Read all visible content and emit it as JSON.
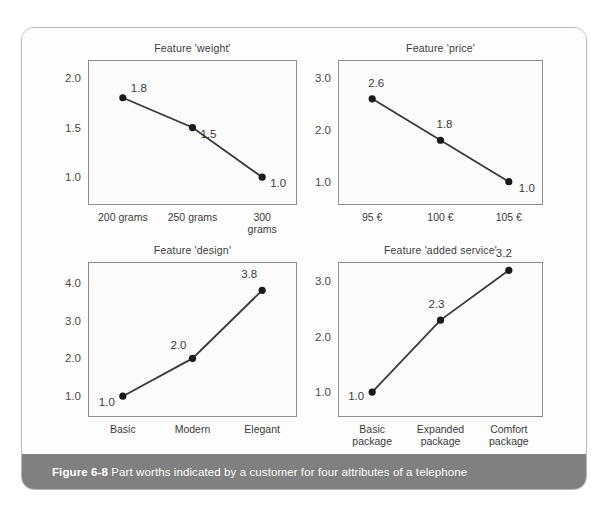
{
  "figure": {
    "caption_label": "Figure 6-8",
    "caption_text": "Part worths indicated by a customer for four attributes of a telephone",
    "caption_bar_color": "#808080",
    "card_border_color": "#b9b9b9",
    "background_color": "#ffffff"
  },
  "chart_data": [
    {
      "type": "line",
      "title": "Feature 'weight'",
      "categories": [
        "200 grams",
        "250 grams",
        "300 grams"
      ],
      "values": [
        1.8,
        1.5,
        1.0
      ],
      "point_labels": [
        "1.8",
        "1.5",
        "1.0"
      ],
      "yticks": [
        "1.0",
        "1.5",
        "2.0"
      ],
      "ytick_values": [
        1.0,
        1.5,
        2.0
      ],
      "ylim": [
        0.72,
        2.18
      ],
      "xlabel": "",
      "ylabel": "",
      "grid": false,
      "legend": "none",
      "marker": "filled-circle",
      "line_color": "#3a3a3a"
    },
    {
      "type": "line",
      "title": "Feature 'price'",
      "categories": [
        "95 €",
        "100 €",
        "105 €"
      ],
      "values": [
        2.6,
        1.8,
        1.0
      ],
      "point_labels": [
        "2.6",
        "1.8",
        "1.0"
      ],
      "yticks": [
        "1.0",
        "2.0",
        "3.0"
      ],
      "ytick_values": [
        1.0,
        2.0,
        3.0
      ],
      "ylim": [
        0.55,
        3.35
      ],
      "xlabel": "",
      "ylabel": "",
      "grid": false,
      "legend": "none",
      "marker": "filled-circle",
      "line_color": "#3a3a3a"
    },
    {
      "type": "line",
      "title": "Feature 'design'",
      "categories": [
        "Basic",
        "Modern",
        "Elegant"
      ],
      "values": [
        1.0,
        2.0,
        3.8
      ],
      "point_labels": [
        "1.0",
        "2.0",
        "3.8"
      ],
      "yticks": [
        "1.0",
        "2.0",
        "3.0",
        "4.0"
      ],
      "ytick_values": [
        1.0,
        2.0,
        3.0,
        4.0
      ],
      "ylim": [
        0.45,
        4.55
      ],
      "xlabel": "",
      "ylabel": "",
      "grid": false,
      "legend": "none",
      "marker": "filled-circle",
      "line_color": "#3a3a3a"
    },
    {
      "type": "line",
      "title": "Feature 'added service'",
      "categories": [
        "Basic\npackage",
        "Expanded\npackage",
        "Comfort\npackage"
      ],
      "values": [
        1.0,
        2.3,
        3.2
      ],
      "point_labels": [
        "1.0",
        "2.3",
        "3.2"
      ],
      "yticks": [
        "1.0",
        "2.0",
        "3.0"
      ],
      "ytick_values": [
        1.0,
        2.0,
        3.0
      ],
      "ylim": [
        0.55,
        3.35
      ],
      "xlabel": "",
      "ylabel": "",
      "grid": false,
      "legend": "none",
      "marker": "filled-circle",
      "line_color": "#3a3a3a"
    }
  ]
}
